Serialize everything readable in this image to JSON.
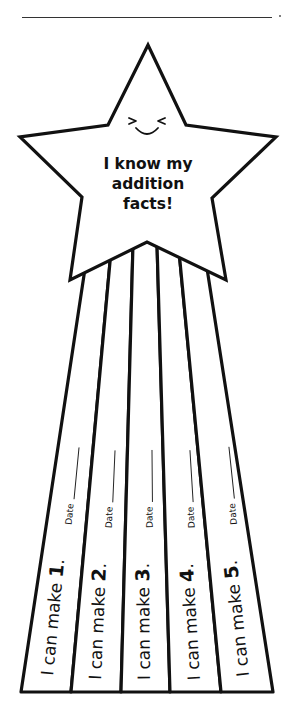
{
  "header": {
    "name_line": "",
    "trailing_mark": "."
  },
  "star": {
    "face": "smiling-squint-face",
    "title_lines": [
      "I know my",
      "addition",
      "facts!"
    ]
  },
  "strips": [
    {
      "prefix": "I can make ",
      "number": "1",
      "suffix": ".",
      "date_label": "Date"
    },
    {
      "prefix": "I can make ",
      "number": "2",
      "suffix": ".",
      "date_label": "Date"
    },
    {
      "prefix": "I can make ",
      "number": "3",
      "suffix": ".",
      "date_label": "Date"
    },
    {
      "prefix": "I can make ",
      "number": "4",
      "suffix": ".",
      "date_label": "Date"
    },
    {
      "prefix": "I can make ",
      "number": "5",
      "suffix": ".",
      "date_label": "Date"
    }
  ],
  "colors": {
    "stroke": "#111111",
    "background": "#ffffff"
  }
}
